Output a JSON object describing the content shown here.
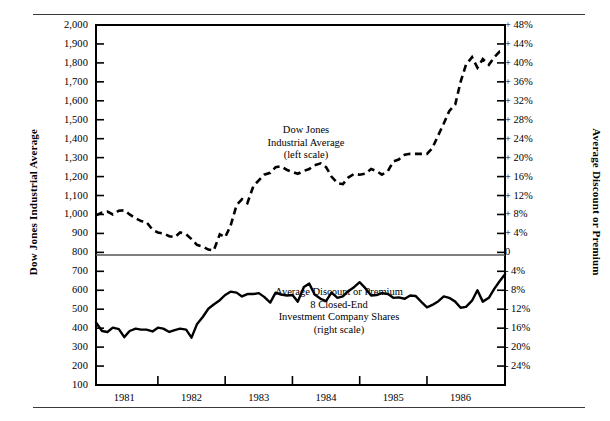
{
  "figure": {
    "left_axis_title": "Dow Jones Industrial Average",
    "right_axis_title": "Average Discount or Premium"
  },
  "annotations": {
    "djia": [
      "Dow Jones",
      "Industrial Average",
      "(left scale)"
    ],
    "discount": [
      "Average Discount or Premium",
      "8 Closed-End",
      "Investment Company Shares",
      "(right scale)"
    ]
  },
  "chart_data": {
    "type": "line",
    "title": "",
    "subtitle": "",
    "xlabel": "",
    "grid": false,
    "legend": "in-plot annotations",
    "x_axis": {
      "tick_labels": [
        "1981",
        "1982",
        "1983",
        "1984",
        "1985",
        "1986"
      ],
      "tick_positions_year": [
        1981,
        1982,
        1983,
        1984,
        1985,
        1986
      ],
      "range": [
        1980.58,
        1986.66
      ]
    },
    "left_axis": {
      "label": "Dow Jones Industrial Average",
      "tick_labels": [
        "2,000",
        "1,900",
        "1,800",
        "1,700",
        "1,600",
        "1,500",
        "1,400",
        "1,300",
        "1,200",
        "1,100",
        "1,000",
        "900",
        "800",
        "700",
        "600",
        "500",
        "400",
        "300",
        "200",
        "100"
      ],
      "tick_values": [
        2000,
        1900,
        1800,
        1700,
        1600,
        1500,
        1400,
        1300,
        1200,
        1100,
        1000,
        900,
        800,
        700,
        600,
        500,
        400,
        300,
        200,
        100
      ],
      "ylim": [
        100,
        2000
      ]
    },
    "right_axis": {
      "label": "Average Discount or Premium",
      "tick_labels": [
        "+ 48%",
        "+ 44%",
        "+ 40%",
        "+ 36%",
        "+ 32%",
        "+ 28%",
        "+ 24%",
        "+ 20%",
        "+ 16%",
        "+ 12%",
        "+ 8%",
        "+ 4%",
        "0",
        "- 4%",
        "- 8%",
        "- 12%",
        "- 16%",
        "- 20%",
        "- 24%"
      ],
      "tick_values": [
        48,
        44,
        40,
        36,
        32,
        28,
        24,
        20,
        16,
        12,
        8,
        4,
        0,
        -4,
        -8,
        -12,
        -16,
        -20,
        -24
      ],
      "ylim": [
        -28,
        52
      ]
    },
    "zero_reference_line": {
      "left_value": 800,
      "right_value": 0
    },
    "series": [
      {
        "name": "Dow Jones Industrial Average (left scale)",
        "axis": "left",
        "style": "dashed",
        "x": [
          1980.58,
          1980.67,
          1980.75,
          1980.83,
          1980.92,
          1981.0,
          1981.08,
          1981.17,
          1981.25,
          1981.33,
          1981.42,
          1981.5,
          1981.58,
          1981.67,
          1981.75,
          1981.83,
          1981.92,
          1982.0,
          1982.08,
          1982.17,
          1982.25,
          1982.33,
          1982.42,
          1982.5,
          1982.58,
          1982.67,
          1982.75,
          1982.83,
          1982.92,
          1983.0,
          1983.08,
          1983.17,
          1983.25,
          1983.33,
          1983.42,
          1983.5,
          1983.58,
          1983.67,
          1983.75,
          1983.83,
          1983.92,
          1984.0,
          1984.08,
          1984.17,
          1984.25,
          1984.33,
          1984.42,
          1984.5,
          1984.58,
          1984.67,
          1984.75,
          1984.83,
          1984.92,
          1985.0,
          1985.08,
          1985.17,
          1985.25,
          1985.33,
          1985.42,
          1985.5,
          1985.58,
          1985.67,
          1985.75,
          1985.83,
          1985.92,
          1986.0,
          1986.08,
          1986.17,
          1986.25,
          1986.33,
          1986.42,
          1986.5,
          1986.58,
          1986.66
        ],
        "values": [
          995,
          1010,
          1015,
          1000,
          1020,
          1022,
          1000,
          980,
          965,
          960,
          920,
          905,
          900,
          885,
          880,
          905,
          895,
          870,
          840,
          830,
          815,
          810,
          895,
          880,
          940,
          1050,
          1080,
          1060,
          1150,
          1180,
          1210,
          1220,
          1250,
          1255,
          1235,
          1225,
          1215,
          1230,
          1240,
          1260,
          1270,
          1250,
          1200,
          1165,
          1160,
          1195,
          1215,
          1210,
          1215,
          1240,
          1230,
          1210,
          1230,
          1280,
          1290,
          1315,
          1320,
          1320,
          1320,
          1320,
          1350,
          1420,
          1480,
          1545,
          1580,
          1700,
          1790,
          1830,
          1775,
          1820,
          1790,
          1830,
          1860,
          1860
        ]
      },
      {
        "name": "Average Discount or Premium, 8 Closed-End Investment Company Shares (right scale)",
        "axis": "right",
        "style": "solid",
        "x": [
          1980.58,
          1980.67,
          1980.75,
          1980.83,
          1980.92,
          1981.0,
          1981.08,
          1981.17,
          1981.25,
          1981.33,
          1981.42,
          1981.5,
          1981.58,
          1981.67,
          1981.75,
          1981.83,
          1981.92,
          1982.0,
          1982.08,
          1982.17,
          1982.25,
          1982.33,
          1982.42,
          1982.5,
          1982.58,
          1982.67,
          1982.75,
          1982.83,
          1982.92,
          1983.0,
          1983.08,
          1983.17,
          1983.25,
          1983.33,
          1983.42,
          1983.5,
          1983.58,
          1983.67,
          1983.75,
          1983.83,
          1983.92,
          1984.0,
          1984.08,
          1984.17,
          1984.25,
          1984.33,
          1984.42,
          1984.5,
          1984.58,
          1984.67,
          1984.75,
          1984.83,
          1984.92,
          1985.0,
          1985.08,
          1985.17,
          1985.25,
          1985.33,
          1985.42,
          1985.5,
          1985.58,
          1985.67,
          1985.75,
          1985.83,
          1985.92,
          1986.0,
          1986.08,
          1986.17,
          1986.25,
          1986.33,
          1986.42,
          1986.5,
          1986.58,
          1986.66
        ],
        "values": [
          -14.8,
          -16.6,
          -16.8,
          -15.9,
          -16.2,
          -17.9,
          -16.6,
          -16.1,
          -16.3,
          -16.3,
          -16.7,
          -15.9,
          -16.1,
          -16.8,
          -16.4,
          -16.1,
          -16.3,
          -18.0,
          -15.2,
          -13.6,
          -11.9,
          -11.0,
          -10.1,
          -9.0,
          -8.3,
          -8.5,
          -9.3,
          -8.8,
          -8.8,
          -8.6,
          -9.4,
          -10.6,
          -8.5,
          -8.9,
          -9.1,
          -9.0,
          -10.4,
          -7.3,
          -6.6,
          -8.9,
          -9.8,
          -10.3,
          -8.5,
          -9.6,
          -9.3,
          -8.2,
          -7.3,
          -6.3,
          -7.5,
          -9.1,
          -9.0,
          -8.6,
          -8.8,
          -9.6,
          -9.5,
          -9.8,
          -9.1,
          -9.2,
          -10.5,
          -11.6,
          -11.1,
          -10.3,
          -9.3,
          -9.6,
          -10.4,
          -11.7,
          -11.5,
          -10.2,
          -8.0,
          -10.4,
          -9.6,
          -7.7,
          -6.1,
          -4.6
        ]
      }
    ]
  }
}
